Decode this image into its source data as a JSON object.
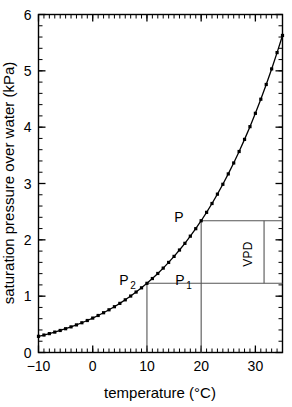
{
  "chart_data": {
    "type": "line",
    "title": "",
    "xlabel": "temperature  (°C)",
    "ylabel": "saturation pressure over water (kPa)",
    "xlim": [
      -10,
      35
    ],
    "ylim": [
      0,
      6
    ],
    "xticks": [
      -10,
      0,
      10,
      20,
      30
    ],
    "xtick_labels": [
      "−10",
      "0",
      "10",
      "20",
      "30"
    ],
    "yticks": [
      0,
      1,
      2,
      3,
      4,
      5,
      6
    ],
    "ytick_labels": [
      "0",
      "1",
      "2",
      "3",
      "4",
      "5",
      "6"
    ],
    "x_minor_step": 1,
    "y_minor_step": 0.2,
    "grid": false,
    "legend": false,
    "marker": "square",
    "series": [
      {
        "name": "saturation vapour pressure over water",
        "x": [
          -10,
          -9,
          -8,
          -7,
          -6,
          -5,
          -4,
          -3,
          -2,
          -1,
          0,
          1,
          2,
          3,
          4,
          5,
          6,
          7,
          8,
          9,
          10,
          11,
          12,
          13,
          14,
          15,
          16,
          17,
          18,
          19,
          20,
          21,
          22,
          23,
          24,
          25,
          26,
          27,
          28,
          29,
          30,
          31,
          32,
          33,
          34,
          35
        ],
        "values": [
          0.287,
          0.31,
          0.335,
          0.362,
          0.391,
          0.422,
          0.455,
          0.49,
          0.528,
          0.568,
          0.611,
          0.657,
          0.706,
          0.758,
          0.813,
          0.872,
          0.935,
          1.002,
          1.073,
          1.148,
          1.228,
          1.313,
          1.403,
          1.498,
          1.599,
          1.706,
          1.819,
          1.938,
          2.065,
          2.198,
          2.339,
          2.488,
          2.645,
          2.811,
          2.986,
          3.17,
          3.364,
          3.568,
          3.783,
          4.009,
          4.246,
          4.496,
          4.758,
          5.034,
          5.324,
          5.628
        ]
      }
    ],
    "annotations": [
      {
        "name": "P",
        "label": "P",
        "sub": "",
        "x": 20,
        "y": 2.339
      },
      {
        "name": "P1",
        "label": "P",
        "sub": "1",
        "x": 20,
        "y": 1.228
      },
      {
        "name": "P2",
        "label": "P",
        "sub": "2",
        "x": 10,
        "y": 1.228
      },
      {
        "name": "VPD",
        "label": "VPD",
        "bracket_x": 31.6,
        "y_top": 2.339,
        "y_bottom": 1.228
      }
    ],
    "guide_lines": [
      {
        "name": "p-horizontal",
        "type": "horizontal",
        "y": 2.339,
        "x_from": 20,
        "x_to": 35
      },
      {
        "name": "p2-horizontal",
        "type": "horizontal",
        "y": 1.228,
        "x_from": 10,
        "x_to": 35
      },
      {
        "name": "t1-vertical",
        "type": "vertical",
        "x": 10,
        "y_from": 0,
        "y_to": 1.228
      },
      {
        "name": "t2-vertical",
        "type": "vertical",
        "x": 20,
        "y_from": 0,
        "y_to": 2.339
      }
    ],
    "colors": {
      "line": "#000000",
      "marker": "#000000",
      "axis": "#000000",
      "guide": "#555555",
      "background": "#ffffff"
    }
  }
}
